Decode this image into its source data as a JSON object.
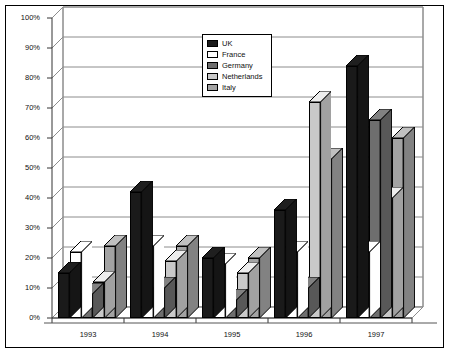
{
  "chart_data": {
    "type": "bar",
    "title": "",
    "subtitle": "",
    "xlabel": "",
    "ylabel": "",
    "categories": [
      "1993",
      "1994",
      "1995",
      "1996",
      "1997"
    ],
    "series": [
      {
        "name": "UK",
        "color": "#1a1a1a",
        "values": [
          15,
          42,
          20,
          36,
          84
        ]
      },
      {
        "name": "France",
        "color": "#ffffff",
        "values": [
          22,
          24,
          18,
          22,
          22
        ]
      },
      {
        "name": "Germany",
        "color": "#6e6e6e",
        "values": [
          8,
          10,
          6,
          10,
          66
        ]
      },
      {
        "name": "Netherlands",
        "color": "#c9c9c9",
        "values": [
          12,
          19,
          15,
          72,
          40
        ]
      },
      {
        "name": "Italy",
        "color": "#a3a3a3",
        "values": [
          24,
          24,
          20,
          53,
          60
        ]
      }
    ],
    "ylim": [
      0,
      100
    ],
    "yticks": [
      0,
      10,
      20,
      30,
      40,
      50,
      60,
      70,
      80,
      90,
      100
    ],
    "ytick_labels": [
      "0%",
      "10%",
      "20%",
      "30%",
      "40%",
      "50%",
      "60%",
      "70%",
      "80%",
      "90%",
      "100%"
    ],
    "grid": true,
    "grid_axis": "y",
    "legend_position": "top-center",
    "three_d": true,
    "plot_background": "#ffffff",
    "border_color": "#000000",
    "grid_color": "#8c8c8c"
  }
}
